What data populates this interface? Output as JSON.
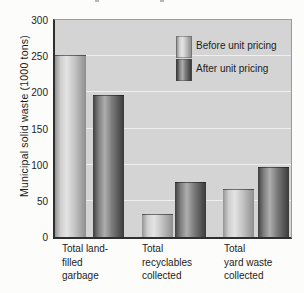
{
  "chart_data": {
    "type": "bar",
    "title": "",
    "ylabel": "Municipal solid waste (1000 tons)",
    "xlabel": "",
    "categories": [
      "Total land-filled garbage",
      "Total recyclables collected",
      "Total yard waste collected"
    ],
    "categories_display": [
      "Total land-\nfilled\ngarbage",
      "Total\nrecyclables\ncollected",
      "Total\nyard waste\ncollected"
    ],
    "series": [
      {
        "name": "Before unit pricing",
        "values": [
          250,
          30,
          65
        ]
      },
      {
        "name": "After unit pricing",
        "values": [
          195,
          75,
          95
        ]
      }
    ],
    "ylim": [
      0,
      300
    ],
    "yticks": [
      0,
      50,
      100,
      150,
      200,
      250,
      300
    ],
    "grid": "horizontal",
    "legend_position": "top-right-inside"
  },
  "colors": {
    "page_background": "#fcfcfa",
    "plot_background": "#d4d4d4",
    "gridline": "#efefed",
    "axis": "#2f2f2f",
    "plot_border": "#9b9b9b",
    "text": "#1c1c1c",
    "before_bar_gradient": [
      "#949494",
      "#cfcfcf",
      "#e4e4e4",
      "#c6c6c6",
      "#8e8e8e"
    ],
    "after_bar_gradient": [
      "#3f3f3f",
      "#7e7e7e",
      "#aeaeae",
      "#7a7a7a",
      "#3a3a3a"
    ]
  }
}
